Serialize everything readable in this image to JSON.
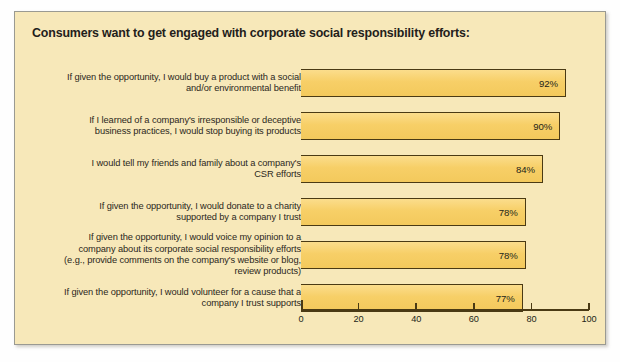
{
  "chart_data": {
    "type": "bar",
    "orientation": "horizontal",
    "title": "Consumers want to get engaged with corporate social responsibility efforts:",
    "xlabel": "",
    "ylabel": "",
    "xlim": [
      0,
      100
    ],
    "xticks": [
      0,
      20,
      40,
      60,
      80,
      100
    ],
    "xtick_labels": [
      "0",
      "20",
      "40",
      "60",
      "80",
      "100"
    ],
    "grid": false,
    "legend": "none",
    "value_suffix": "%",
    "colors": {
      "panel_background": "#f7e8b9",
      "bar_fill": "#f7cf67",
      "bar_edge": "#4a3a14",
      "text": "#241f18",
      "panel_border": "#9a9a92"
    },
    "categories": [
      "If given the opportunity, I would buy a product with a social and/or environmental benefit",
      "If I learned of a company's irresponsible or deceptive business practices, I would stop buying its products",
      "I would tell my friends and family about a company's CSR efforts",
      "If given the opportunity, I would donate to a charity supported by a company I trust",
      "If given the opportunity, I would voice my opinion to a company about its corporate social responsibility efforts (e.g., provide comments on the company's website or blog, review products)",
      "If given the opportunity, I would volunteer for a cause that a company I trust supports"
    ],
    "category_lines": [
      [
        "If given the opportunity, I would buy a product with a social",
        "and/or environmental benefit"
      ],
      [
        "If I learned of a company's irresponsible or deceptive",
        "business practices, I would stop buying its products"
      ],
      [
        "I would tell my friends and family about a company's",
        "CSR efforts"
      ],
      [
        "If given the opportunity, I would donate to a charity",
        "supported by a company I trust"
      ],
      [
        "If given the opportunity, I would voice my opinion to a",
        "company about its corporate social responsibility efforts",
        "(e.g., provide comments on the company's website or blog,",
        "review products)"
      ],
      [
        "If given the opportunity, I would volunteer for a cause that a",
        "company I trust supports"
      ]
    ],
    "values": [
      92,
      90,
      84,
      78,
      78,
      77
    ],
    "value_labels": [
      "92%",
      "90%",
      "84%",
      "78%",
      "78%",
      "77%"
    ]
  }
}
